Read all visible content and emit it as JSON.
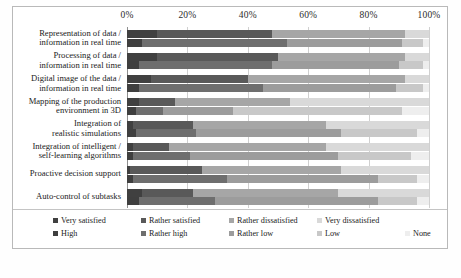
{
  "figure": {
    "caption": "",
    "background": "#ffffff"
  },
  "axis": {
    "ticks": [
      "0%",
      "20%",
      "40%",
      "60%",
      "80%",
      "100%"
    ],
    "tick_values": [
      0,
      20,
      40,
      60,
      80,
      100
    ],
    "min": 0,
    "max": 100
  },
  "legend": {
    "row1": [
      {
        "label": "Very satisfied",
        "color": "#404040"
      },
      {
        "label": "Rather satisfied",
        "color": "#595959"
      },
      {
        "label": "Rather dissatisfied",
        "color": "#a6a6a6"
      },
      {
        "label": "Very dissatisfied",
        "color": "#d9d9d9"
      }
    ],
    "row2": [
      {
        "label": "High",
        "color": "#3f3f3f"
      },
      {
        "label": "Rather high",
        "color": "#6e6e6e"
      },
      {
        "label": "Rather low",
        "color": "#9c9c9c"
      },
      {
        "label": "Low",
        "color": "#c8c8c8"
      },
      {
        "label": "None",
        "color": "#eeeeee"
      }
    ]
  },
  "chart_data": {
    "type": "bar",
    "orientation": "horizontal",
    "stacked": true,
    "normalized_percent": true,
    "title": "",
    "xlabel": "",
    "ylabel": "",
    "xlim": [
      0,
      100
    ],
    "grid": true,
    "legend_position": "bottom",
    "categories": [
      "Representation of data /\ninformation in real time",
      "Processing of data /\ninformation in real time",
      "Digital image of the data /\ninformation in real time",
      "Mapping of the production\nenvironment in 3D",
      "Integration of\nrealistic simulations",
      "Integration of intelligent /\nself-learning algorithms",
      "Proactive decision support",
      "Auto-control of subtasks"
    ],
    "bar_groups": [
      {
        "name": "Satisfaction",
        "series": [
          {
            "name": "Very satisfied",
            "color": "#404040",
            "values": [
              10,
              10,
              8,
              4,
              2,
              2,
              1,
              5
            ]
          },
          {
            "name": "Rather satisfied",
            "color": "#595959",
            "values": [
              38,
              40,
              32,
              12,
              20,
              12,
              24,
              17
            ]
          },
          {
            "name": "Rather dissatisfied",
            "color": "#a6a6a6",
            "values": [
              44,
              42,
              52,
              38,
              44,
              52,
              46,
              48
            ]
          },
          {
            "name": "Very dissatisfied",
            "color": "#d9d9d9",
            "values": [
              8,
              8,
              8,
              46,
              34,
              34,
              29,
              30
            ]
          }
        ]
      },
      {
        "name": "Capability",
        "series": [
          {
            "name": "High",
            "color": "#3f3f3f",
            "values": [
              5,
              4,
              4,
              3,
              3,
              2,
              2,
              4
            ]
          },
          {
            "name": "Rather high",
            "color": "#6e6e6e",
            "values": [
              48,
              44,
              41,
              9,
              20,
              19,
              31,
              25
            ]
          },
          {
            "name": "Rather low",
            "color": "#9c9c9c",
            "values": [
              38,
              42,
              44,
              23,
              48,
              49,
              50,
              54
            ]
          },
          {
            "name": "Low",
            "color": "#c8c8c8",
            "values": [
              7,
              8,
              9,
              56,
              25,
              24,
              13,
              13
            ]
          },
          {
            "name": "None",
            "color": "#eeeeee",
            "values": [
              2,
              2,
              2,
              9,
              4,
              6,
              4,
              4
            ]
          }
        ]
      }
    ]
  }
}
